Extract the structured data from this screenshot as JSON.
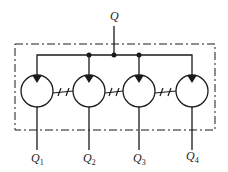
{
  "diagram": {
    "type": "hydraulic flow divider (4 coupled motors)",
    "input_label": "Q",
    "output_labels": [
      "Q",
      "Q",
      "Q",
      "Q"
    ],
    "output_subscripts": [
      "1",
      "2",
      "3",
      "4"
    ],
    "units": 4,
    "colors": {
      "stroke": "#1a1a1a",
      "background": "#ffffff"
    }
  }
}
